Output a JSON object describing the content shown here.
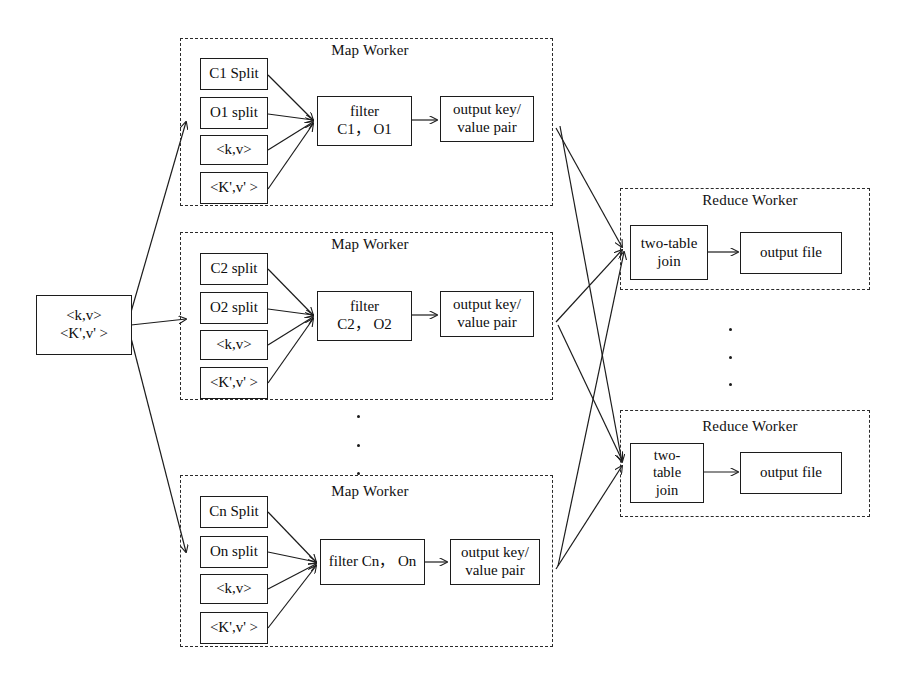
{
  "diagram": {
    "input": {
      "name": "input-key-value-box",
      "line1": "<k,v>",
      "line2": "<K',v' >"
    },
    "map_workers": [
      {
        "title": "Map Worker",
        "splits": [
          "C1 Split",
          "O1 split",
          "<k,v>",
          "<K',v' >"
        ],
        "filter": "filter\nC1， O1",
        "output": "output key/\nvalue pair"
      },
      {
        "title": "Map Worker",
        "splits": [
          "C2 split",
          "O2 split",
          "<k,v>",
          "<K',v' >"
        ],
        "filter": "filter\nC2， O2",
        "output": "output key/\nvalue pair"
      },
      {
        "title": "Map Worker",
        "splits": [
          "Cn Split",
          "On split",
          "<k,v>",
          "<K',v' >"
        ],
        "filter": "filter Cn， On",
        "output": "output key/\nvalue pair"
      }
    ],
    "reduce_workers": [
      {
        "title": "Reduce Worker",
        "join": "two-table\njoin",
        "output": "output file"
      },
      {
        "title": "Reduce Worker",
        "join": "two-\ntable\njoin",
        "output": "output file"
      }
    ],
    "ellipsis": {
      "map_gap": "vertical-ellipsis",
      "reduce_gap": "vertical-ellipsis"
    },
    "colors": {
      "stroke": "#1c1c1c",
      "dashed": "#2b2b2b",
      "background": "#ffffff",
      "text": "#0d0d0d"
    }
  }
}
